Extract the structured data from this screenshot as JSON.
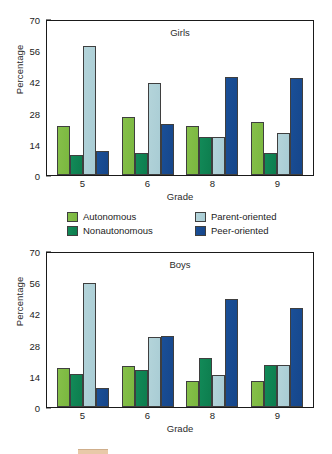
{
  "chart_data": [
    {
      "type": "bar",
      "title": "Girls",
      "xlabel": "Grade",
      "ylabel": "Percentage",
      "categories": [
        "5",
        "6",
        "8",
        "9"
      ],
      "ylim": [
        0,
        70
      ],
      "yticks": [
        0,
        14,
        28,
        42,
        56,
        70
      ],
      "grid": false,
      "legend_position": "between-panels",
      "series": [
        {
          "name": "Autonomous",
          "color": "#7ab73f",
          "values": [
            22,
            26,
            22,
            24
          ]
        },
        {
          "name": "Nonautonomous",
          "color": "#0d7d4e",
          "values": [
            9,
            10,
            17,
            10
          ]
        },
        {
          "name": "Parent-oriented",
          "color": "#a8ccd4",
          "values": [
            58,
            41.5,
            17,
            19
          ]
        },
        {
          "name": "Peer-oriented",
          "color": "#16468a",
          "values": [
            11,
            23,
            44,
            43.5
          ]
        }
      ]
    },
    {
      "type": "bar",
      "title": "Boys",
      "xlabel": "Grade",
      "ylabel": "Percentage",
      "categories": [
        "5",
        "6",
        "8",
        "9"
      ],
      "ylim": [
        0,
        70
      ],
      "yticks": [
        0,
        14,
        28,
        42,
        56,
        70
      ],
      "grid": false,
      "legend_position": "between-panels",
      "series": [
        {
          "name": "Autonomous",
          "color": "#7ab73f",
          "values": [
            17.5,
            18.5,
            11.5,
            11.5
          ]
        },
        {
          "name": "Nonautonomous",
          "color": "#0d7d4e",
          "values": [
            15,
            16.5,
            22,
            19
          ]
        },
        {
          "name": "Parent-oriented",
          "color": "#a8ccd4",
          "values": [
            55.5,
            31.5,
            14.5,
            19
          ]
        },
        {
          "name": "Peer-oriented",
          "color": "#16468a",
          "values": [
            8.5,
            32,
            48.5,
            44.5
          ]
        }
      ]
    }
  ],
  "legend": {
    "items": [
      {
        "label": "Autonomous",
        "key": "autonomous"
      },
      {
        "label": "Nonautonomous",
        "key": "nonautonomous"
      },
      {
        "label": "Parent-oriented",
        "key": "parent"
      },
      {
        "label": "Peer-oriented",
        "key": "peer"
      }
    ]
  }
}
